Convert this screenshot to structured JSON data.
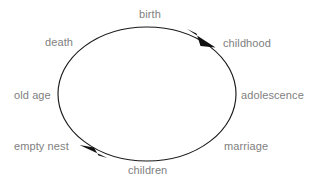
{
  "diagram": {
    "type": "cycle",
    "direction": "clockwise",
    "background_color": "#ffffff",
    "stroke_color": "#1a1a1a",
    "label_color": "#808080",
    "ellipse": {
      "center_x": 147,
      "center_y": 94,
      "radius_x": 89,
      "radius_y": 67
    },
    "nodes": [
      {
        "id": "birth",
        "label": "birth"
      },
      {
        "id": "childhood",
        "label": "childhood"
      },
      {
        "id": "adolescence",
        "label": "adolescence"
      },
      {
        "id": "marriage",
        "label": "marriage"
      },
      {
        "id": "children",
        "label": "children"
      },
      {
        "id": "empty-nest",
        "label": "empty nest"
      },
      {
        "id": "old-age",
        "label": "old age"
      },
      {
        "id": "death",
        "label": "death"
      }
    ],
    "arrowheads": [
      {
        "id": "arrow-top-right",
        "position": "top-right",
        "points": "clockwise"
      },
      {
        "id": "arrow-bottom-left",
        "position": "bottom-left",
        "points": "clockwise"
      }
    ]
  }
}
